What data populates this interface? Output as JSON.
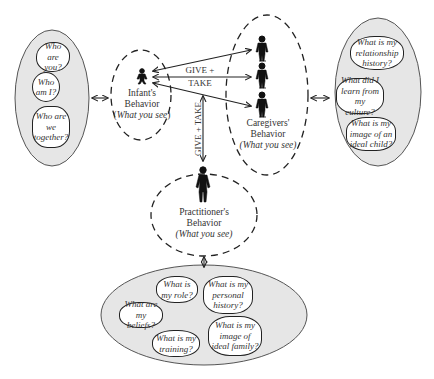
{
  "left_group": {
    "questions": [
      "Who are you?",
      "Who am I?",
      "Who are we together?"
    ]
  },
  "infant": {
    "title": "Infant's",
    "subtitle": "Behavior",
    "note_open": "(",
    "note": "What you see",
    "note_close": ")"
  },
  "caregivers": {
    "title": "Caregivers'",
    "subtitle": "Behavior",
    "note": "(What you see)"
  },
  "practitioner": {
    "title": "Practitioner's",
    "subtitle": "Behavior",
    "note": "(What you see)"
  },
  "right_group": {
    "questions": [
      "What is my relationship history?",
      "What did I learn from my culture?",
      "What is my image of an ideal child?"
    ]
  },
  "bottom_group": {
    "questions": [
      "What is my role?",
      "What is my personal history?",
      "What are my beliefs?",
      "What is my training?",
      "What is my image of ideal family?"
    ]
  },
  "labels": {
    "give_take_horizontal_1": "GIVE +",
    "give_take_horizontal_2": "TAKE",
    "give_take_vertical": "GIVE + TAKE"
  },
  "colors": {
    "oval_fill": "#e6e6e6",
    "stroke": "#222222",
    "bubble_fill": "#ffffff"
  }
}
